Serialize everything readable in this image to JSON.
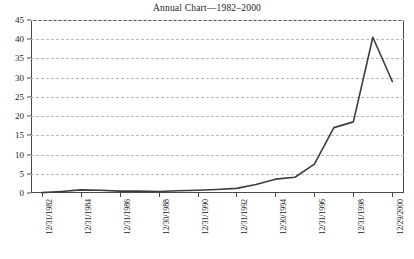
{
  "chart_data": {
    "type": "line",
    "title": "Annual Chart—1982–2000",
    "xlabel": "",
    "ylabel": "",
    "ylim": [
      0,
      45
    ],
    "yticks": [
      0,
      5,
      10,
      15,
      20,
      25,
      30,
      35,
      40,
      45
    ],
    "grid": true,
    "legend": "none",
    "line_color": "#3d3d3d",
    "grid_color": "#b9b9c4",
    "axis_color": "#4a4a4a",
    "xtick_labels": [
      "12/31/1982",
      "12/31/1984",
      "12/31/1986",
      "12/30/1988",
      "12/31/1990",
      "12/31/1992",
      "12/30/1994",
      "12/31/1996",
      "12/31/1998",
      "12/29/2000"
    ],
    "categories": [
      "12/31/1982",
      "12/31/1983",
      "12/31/1984",
      "12/31/1985",
      "12/31/1986",
      "12/31/1987",
      "12/30/1988",
      "12/29/1989",
      "12/31/1990",
      "12/31/1991",
      "12/31/1992",
      "12/31/1993",
      "12/30/1994",
      "12/29/1995",
      "12/31/1996",
      "12/31/1997",
      "12/31/1998",
      "12/31/1999",
      "12/29/2000"
    ],
    "values": [
      0.1,
      0.4,
      0.8,
      0.7,
      0.5,
      0.5,
      0.4,
      0.6,
      0.7,
      0.9,
      1.2,
      2.2,
      3.6,
      4.1,
      7.5,
      17.0,
      18.5,
      40.5,
      29.0
    ]
  },
  "caption": {
    "text": ""
  }
}
